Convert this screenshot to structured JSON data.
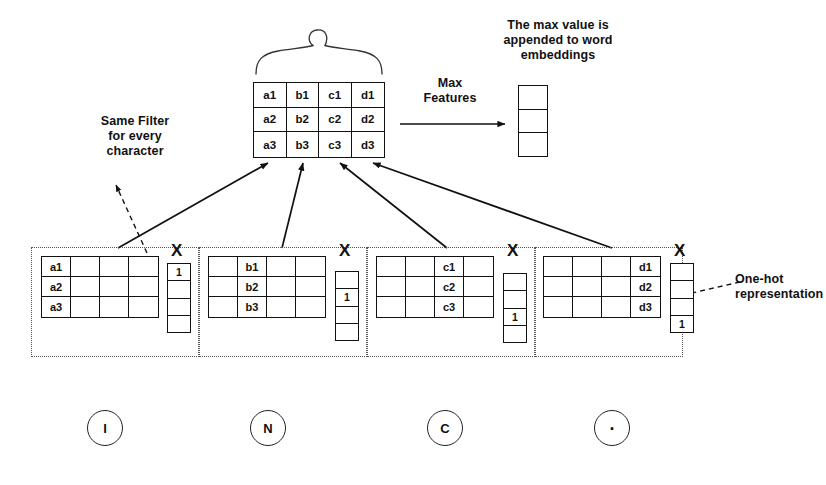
{
  "diagram": {
    "title_semantic": "character-level-cnn-one-hot-max-features",
    "annotations": {
      "same_filter": "Same Filter\nfor every\ncharacter",
      "max_features": "Max\nFeatures",
      "max_value_appended": "The max value is\nappended to word\nembeddings",
      "one_hot": "One-hot\nrepresentation"
    },
    "feature_matrix": {
      "name": "max-features-matrix",
      "columns": 4,
      "rows": 3,
      "cells": [
        [
          "a1",
          "b1",
          "c1",
          "d1"
        ],
        [
          "a2",
          "b2",
          "c2",
          "d2"
        ],
        [
          "a3",
          "b3",
          "c3",
          "d3"
        ]
      ]
    },
    "embedding_column": {
      "name": "word-embedding-column",
      "cells": [
        "",
        "",
        ""
      ]
    },
    "character_groups": [
      {
        "char": "I",
        "matrix_columns": 4,
        "matrix_rows": 3,
        "cells": [
          [
            "a1",
            "",
            "",
            ""
          ],
          [
            "a2",
            "",
            "",
            ""
          ],
          [
            "a3",
            "",
            "",
            ""
          ]
        ],
        "operator": "X",
        "onehot": [
          "1",
          "",
          "",
          ""
        ]
      },
      {
        "char": "N",
        "matrix_columns": 4,
        "matrix_rows": 3,
        "cells": [
          [
            "",
            "b1",
            "",
            ""
          ],
          [
            "",
            "b2",
            "",
            ""
          ],
          [
            "",
            "b3",
            "",
            ""
          ]
        ],
        "operator": "X",
        "onehot": [
          "",
          "1",
          "",
          ""
        ]
      },
      {
        "char": "C",
        "matrix_columns": 4,
        "matrix_rows": 3,
        "cells": [
          [
            "",
            "",
            "c1",
            ""
          ],
          [
            "",
            "",
            "c2",
            ""
          ],
          [
            "",
            "",
            "c3",
            ""
          ]
        ],
        "operator": "X",
        "onehot": [
          "",
          "",
          "1",
          ""
        ]
      },
      {
        "char": ".",
        "matrix_columns": 4,
        "matrix_rows": 3,
        "cells": [
          [
            "",
            "",
            "",
            "d1"
          ],
          [
            "",
            "",
            "",
            "d2"
          ],
          [
            "",
            "",
            "",
            "d3"
          ]
        ],
        "operator": "X",
        "onehot": [
          "",
          "",
          "",
          "1"
        ]
      }
    ],
    "colors": {
      "stroke": "#111111",
      "dotted": "#555555",
      "background": "#ffffff"
    }
  }
}
